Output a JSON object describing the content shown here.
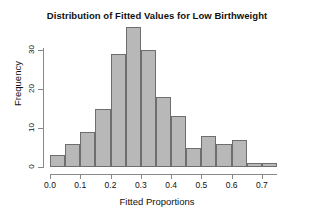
{
  "chart_data": {
    "type": "bar",
    "title": "Distribution of Fitted Values for Low Birthweight",
    "xlabel": "Fitted Proportions",
    "ylabel": "Frequency",
    "bin_width": 0.05,
    "bin_starts": [
      0.0,
      0.05,
      0.1,
      0.15,
      0.2,
      0.25,
      0.3,
      0.35,
      0.4,
      0.45,
      0.5,
      0.55,
      0.6,
      0.65,
      0.7
    ],
    "bin_ends": [
      0.05,
      0.1,
      0.15,
      0.2,
      0.25,
      0.3,
      0.35,
      0.4,
      0.45,
      0.5,
      0.55,
      0.6,
      0.65,
      0.7,
      0.75
    ],
    "categories": [
      "0.00-0.05",
      "0.05-0.10",
      "0.10-0.15",
      "0.15-0.20",
      "0.20-0.25",
      "0.25-0.30",
      "0.30-0.35",
      "0.35-0.40",
      "0.40-0.45",
      "0.45-0.50",
      "0.50-0.55",
      "0.55-0.60",
      "0.60-0.65",
      "0.65-0.70",
      "0.70-0.75"
    ],
    "values": [
      3,
      6,
      9,
      15,
      29,
      36,
      30,
      18,
      13,
      5,
      8,
      6,
      7,
      1,
      1
    ],
    "xlim": [
      0.0,
      0.75
    ],
    "ylim": [
      0,
      36
    ],
    "xticks": [
      0.0,
      0.1,
      0.2,
      0.3,
      0.4,
      0.5,
      0.6,
      0.7
    ],
    "xtick_labels": [
      "0.0",
      "0.1",
      "0.2",
      "0.3",
      "0.4",
      "0.5",
      "0.6",
      "0.7"
    ],
    "yticks": [
      0,
      10,
      20,
      30
    ],
    "ytick_labels": [
      "0",
      "10",
      "20",
      "30"
    ],
    "grid": false,
    "legend": null,
    "bar_fill_color": "#b8b8b8",
    "bar_border_color": "#6e6e6e",
    "axis_color": "#888888",
    "text_color": "#111111",
    "background_color": "#ffffff"
  }
}
